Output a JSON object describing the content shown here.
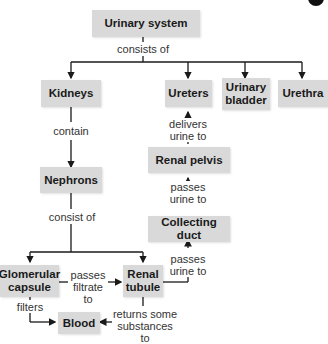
{
  "nodes": {
    "urinary_system": "Urinary system",
    "kidneys": "Kidneys",
    "ureters": "Ureters",
    "urinary_bladder": "Urinary bladder",
    "urethra": "Urethra",
    "nephrons": "Nephrons",
    "renal_pelvis": "Renal pelvis",
    "collecting_duct": "Collecting duct",
    "glomerular_capsule": "Glomerular capsule",
    "renal_tubule": "Renal tubule",
    "blood": "Blood"
  },
  "edges": {
    "consists_of": "consists of",
    "contain": "contain",
    "consist_of": "consist of",
    "delivers_urine_to": "delivers urine to",
    "passes_urine_to_1": "passes urine to",
    "passes_urine_to_2": "passes urine to",
    "passes_filtrate_to": "passes filtrate to",
    "filters": "filters",
    "returns_some_substances_to": "returns some substances to"
  },
  "colors": {
    "box_fill": "#d9d9d9",
    "line": "#1a1a1a"
  }
}
